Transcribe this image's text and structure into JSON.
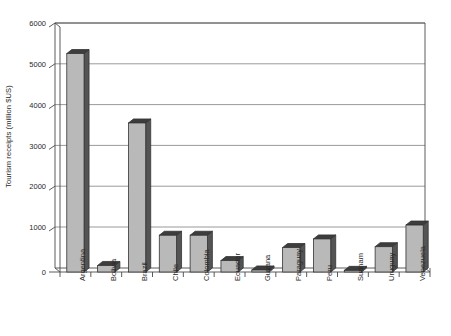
{
  "chart_data": {
    "type": "bar",
    "title": "",
    "subtitle": "",
    "xlabel": "",
    "ylabel": "Tourism receipts (million $US)",
    "ylim": [
      0,
      6000
    ],
    "ytick_labels": [
      "0",
      "1000",
      "2000",
      "3000",
      "4000",
      "5000",
      "6000"
    ],
    "ytick_values": [
      0,
      1000,
      2000,
      3000,
      4000,
      5000,
      6000
    ],
    "grid": true,
    "grid_axis": "y",
    "legend": false,
    "legend_position": "none",
    "style": "3d-column",
    "bar_color": "#b9b9b9",
    "bar_edge_color": "#333333",
    "bar_side_color": "#545454",
    "bar_top_color": "#3d3d3d",
    "categories": [
      "Argentina",
      "Bolivia",
      "Brazil",
      "Chile",
      "Colombia",
      "Ecuador",
      "Guyana",
      "Paraguay",
      "Peru",
      "Surinam",
      "Uruguay",
      "Venezuela"
    ],
    "values": [
      5350,
      160,
      3650,
      900,
      900,
      280,
      50,
      600,
      810,
      40,
      620,
      1150
    ],
    "points": [
      {
        "category": "Argentina",
        "value": 5350
      },
      {
        "category": "Bolivia",
        "value": 160
      },
      {
        "category": "Brazil",
        "value": 3650
      },
      {
        "category": "Chile",
        "value": 900
      },
      {
        "category": "Colombia",
        "value": 900
      },
      {
        "category": "Ecuador",
        "value": 280
      },
      {
        "category": "Guyana",
        "value": 50
      },
      {
        "category": "Paraguay",
        "value": 600
      },
      {
        "category": "Peru",
        "value": 810
      },
      {
        "category": "Surinam",
        "value": 40
      },
      {
        "category": "Uruguay",
        "value": 620
      },
      {
        "category": "Venezuela",
        "value": 1150
      }
    ]
  }
}
